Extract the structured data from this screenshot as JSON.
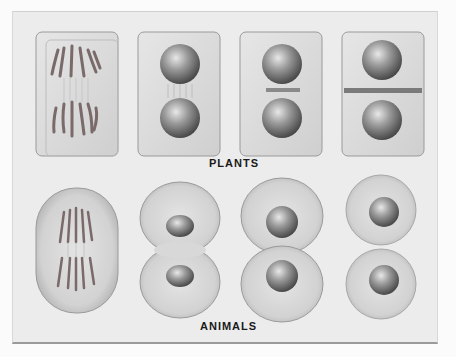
{
  "figure": {
    "rows": [
      {
        "label": "PLANTS",
        "stages": [
          {
            "name": "anaphase",
            "description": "rectangular cell with chromosomes separating along spindle"
          },
          {
            "name": "telophase",
            "description": "two daughter nuclei with spindle fibers between"
          },
          {
            "name": "cell-plate-forming",
            "description": "two nuclei with cell plate beginning at equator"
          },
          {
            "name": "cell-plate-complete",
            "description": "two nuclei separated by complete cell plate"
          }
        ]
      },
      {
        "label": "ANIMALS",
        "stages": [
          {
            "name": "anaphase",
            "description": "oval cell with chromosomes separating along spindle"
          },
          {
            "name": "telophase-furrowing",
            "description": "cleavage furrow pinching cell in two"
          },
          {
            "name": "late-cleavage",
            "description": "daughter cells nearly separated with asters"
          },
          {
            "name": "daughter-cells",
            "description": "two separate round daughter cells"
          }
        ]
      }
    ]
  },
  "colors": {
    "background": "#ececec",
    "cell": "#dcdcdc",
    "nucleus": "#6e6e6e",
    "chromosome": "#7a6a6a",
    "text": "#1a1a1a"
  }
}
